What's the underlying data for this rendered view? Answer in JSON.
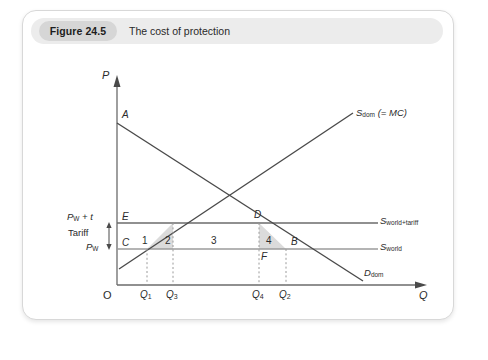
{
  "figure": {
    "number_label": "Figure 24.5",
    "title": "The cost of protection"
  },
  "axes": {
    "y_label": "P",
    "x_label": "Q",
    "origin_label": "O"
  },
  "curves": [
    {
      "id": "supply_dom",
      "label_main": "S",
      "label_sub": "dom",
      "label_tail": " (= MC)"
    },
    {
      "id": "demand_dom",
      "label_main": "D",
      "label_sub": "dom",
      "label_tail": ""
    },
    {
      "id": "supply_world_tariff",
      "label_main": "S",
      "label_sub": "world+tariff",
      "label_tail": ""
    },
    {
      "id": "supply_world",
      "label_main": "S",
      "label_sub": "world",
      "label_tail": ""
    }
  ],
  "price_levels": [
    {
      "id": "pw_plus_t",
      "main": "P",
      "sub": "W",
      "tail": " + t"
    },
    {
      "id": "pw",
      "main": "P",
      "sub": "W",
      "tail": ""
    }
  ],
  "tariff_label": "Tariff",
  "points": [
    {
      "id": "A",
      "label": "A"
    },
    {
      "id": "B",
      "label": "B"
    },
    {
      "id": "C",
      "label": "C"
    },
    {
      "id": "D",
      "label": "D"
    },
    {
      "id": "E",
      "label": "E"
    },
    {
      "id": "F",
      "label": "F"
    }
  ],
  "regions": [
    {
      "id": "region-1",
      "label": "1"
    },
    {
      "id": "region-2",
      "label": "2"
    },
    {
      "id": "region-3",
      "label": "3"
    },
    {
      "id": "region-4",
      "label": "4"
    }
  ],
  "quantity_ticks": [
    {
      "id": "Q1",
      "main": "Q",
      "sub": "1"
    },
    {
      "id": "Q3",
      "main": "Q",
      "sub": "3"
    },
    {
      "id": "Q4",
      "main": "Q",
      "sub": "4"
    },
    {
      "id": "Q2",
      "main": "Q",
      "sub": "2"
    }
  ],
  "colors": {
    "header_band": "#ececec",
    "figure_pill": "#d6d6d6",
    "curve": "#4a4a4a",
    "axis": "#6b6b6b",
    "shade": "#d5d5d5",
    "dotted": "#9a9a9a",
    "text": "#2b2b2b"
  }
}
